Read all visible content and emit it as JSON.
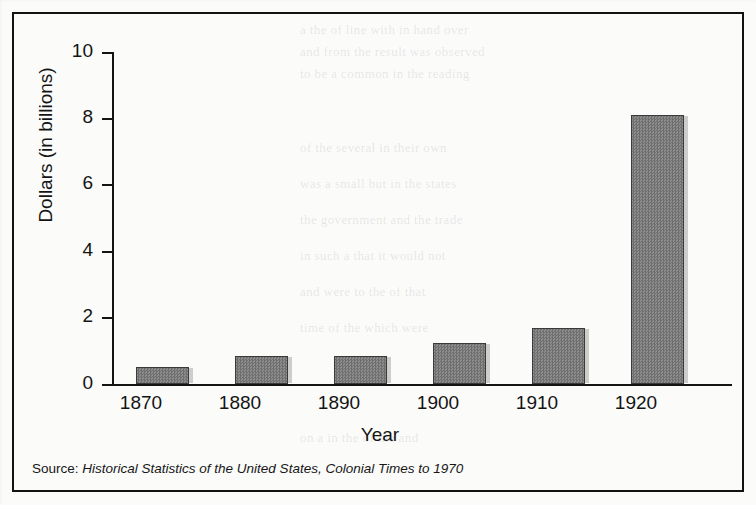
{
  "figure": {
    "source_note_label": "Source:",
    "source_note_title": "Historical Statistics of the United States, Colonial Times to 1970",
    "frame_color": "#121212",
    "bar_fill_color": "#808080",
    "bar_border_color": "#3a3a3a",
    "background_color": "#fbfbfa"
  },
  "chart_data": {
    "type": "bar",
    "title": "",
    "categories": [
      "1870",
      "1880",
      "1890",
      "1900",
      "1910",
      "1920"
    ],
    "values": [
      0.5,
      0.85,
      0.83,
      1.25,
      1.7,
      8.1
    ],
    "xlabel": "Year",
    "ylabel": "Dollars (in billions)",
    "ylim": [
      0,
      10
    ],
    "yticks": [
      0,
      2,
      4,
      6,
      8,
      10
    ],
    "ytick_labels": [
      "0",
      "2",
      "4",
      "6",
      "8",
      "10"
    ],
    "grid": false,
    "legend": false,
    "series": [
      {
        "name": "Dollars (in billions)",
        "values": [
          0.5,
          0.85,
          0.83,
          1.25,
          1.7,
          8.1
        ]
      }
    ]
  },
  "bleed_text": [
    "a the of line with in hand over",
    "and from the result was observed",
    "to be a common in the reading",
    "of the several in their own",
    "was a small but in the states",
    "the government and the trade",
    "in such a that it would not",
    "and were to the of that",
    "time of the which were",
    "on a in the of the and"
  ]
}
